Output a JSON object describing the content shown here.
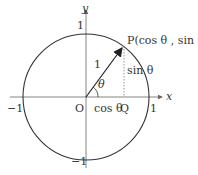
{
  "diagram": {
    "colors": {
      "stroke": "#333333",
      "axis": "#666666",
      "dashed": "#888888",
      "text": "#333333"
    },
    "axes": {
      "x_label": "x",
      "y_label": "y"
    },
    "ticks": {
      "x_pos": "1",
      "x_neg": "−1",
      "y_pos": "1",
      "y_neg": "−1"
    },
    "origin_label": "O",
    "point_p_label": "P(cos θ , sin θ )",
    "point_q_label": "Q",
    "radius_label": "1",
    "angle_label": "θ",
    "cos_label": "cos θ",
    "sin_label": "sin θ"
  }
}
